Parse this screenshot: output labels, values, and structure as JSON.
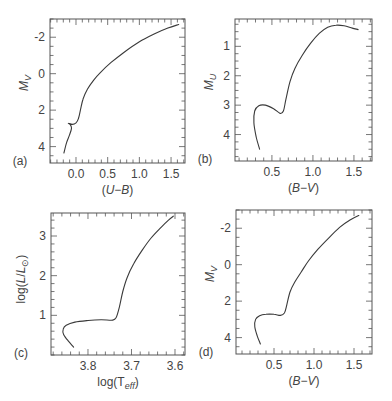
{
  "chart_data": [
    {
      "id": "a",
      "type": "line",
      "panel_label": "(a)",
      "title": "",
      "xlabel": "(U−B)",
      "ylabel": "M_V",
      "ylabel_main": "M",
      "ylabel_sub": "V",
      "xlim": [
        -0.41,
        1.72
      ],
      "ylim": [
        4.9,
        -3.0
      ],
      "y_inverted": true,
      "x_ticks": [
        0.0,
        0.5,
        1.0,
        1.5
      ],
      "x_tick_labels": [
        "0.0",
        "0.5",
        "1.0",
        "1.5"
      ],
      "x_minor_step": 0.1,
      "y_ticks": [
        -2,
        0,
        2,
        4
      ],
      "y_tick_labels": [
        "-2",
        "0",
        "2",
        "4"
      ],
      "y_minor_step": 0.5,
      "grid": false,
      "frame": {
        "left": 50,
        "top": 19,
        "right": 185,
        "bottom": 163
      },
      "series": [
        {
          "name": "isochrone",
          "points": [
            [
              -0.19,
              4.35
            ],
            [
              -0.15,
              3.8
            ],
            [
              -0.1,
              3.35
            ],
            [
              -0.07,
              3.0
            ],
            [
              -0.09,
              2.8
            ],
            [
              -0.12,
              2.72
            ],
            [
              -0.06,
              2.78
            ],
            [
              0.0,
              2.7
            ],
            [
              0.04,
              2.45
            ],
            [
              0.07,
              2.0
            ],
            [
              0.11,
              1.4
            ],
            [
              0.18,
              0.85
            ],
            [
              0.28,
              0.35
            ],
            [
              0.38,
              -0.05
            ],
            [
              0.55,
              -0.6
            ],
            [
              0.75,
              -1.15
            ],
            [
              1.0,
              -1.75
            ],
            [
              1.25,
              -2.2
            ],
            [
              1.45,
              -2.5
            ],
            [
              1.62,
              -2.7
            ]
          ]
        }
      ]
    },
    {
      "id": "b",
      "type": "line",
      "panel_label": "(b)",
      "title": "",
      "xlabel": "(B−V)",
      "ylabel": "M_U",
      "ylabel_main": "M",
      "ylabel_sub": "U",
      "xlim": [
        0.05,
        1.72
      ],
      "ylim": [
        4.9,
        0.07
      ],
      "y_inverted": true,
      "x_ticks": [
        0.5,
        1.0,
        1.5
      ],
      "x_tick_labels": [
        "0.5",
        "1.0",
        "1.5"
      ],
      "x_minor_step": 0.1,
      "y_ticks": [
        1,
        2,
        3,
        4
      ],
      "y_tick_labels": [
        "1",
        "2",
        "3",
        "4"
      ],
      "y_minor_step": 0.25,
      "grid": false,
      "frame": {
        "left": 235,
        "top": 19,
        "right": 372,
        "bottom": 161
      },
      "series": [
        {
          "name": "isochrone",
          "points": [
            [
              0.35,
              4.5
            ],
            [
              0.31,
              4.1
            ],
            [
              0.28,
              3.6
            ],
            [
              0.29,
              3.2
            ],
            [
              0.34,
              3.02
            ],
            [
              0.42,
              3.0
            ],
            [
              0.52,
              3.12
            ],
            [
              0.6,
              3.28
            ],
            [
              0.64,
              3.2
            ],
            [
              0.67,
              2.8
            ],
            [
              0.72,
              2.2
            ],
            [
              0.78,
              1.75
            ],
            [
              0.87,
              1.3
            ],
            [
              0.97,
              0.9
            ],
            [
              1.08,
              0.55
            ],
            [
              1.18,
              0.35
            ],
            [
              1.28,
              0.28
            ],
            [
              1.38,
              0.3
            ],
            [
              1.48,
              0.38
            ],
            [
              1.55,
              0.43
            ]
          ]
        }
      ]
    },
    {
      "id": "c",
      "type": "line",
      "panel_label": "(c)",
      "title": "",
      "xlabel": "log(T_eff)",
      "xlabel_main": "log(T",
      "xlabel_sub": "eff",
      "xlabel_end": ")",
      "ylabel": "log(L/L_⊙)",
      "ylabel_main": "log(L/L",
      "ylabel_sub": "⊙",
      "ylabel_end": ")",
      "xlim": [
        3.885,
        3.577
      ],
      "x_inverted": true,
      "ylim": [
        0.0,
        3.58
      ],
      "x_ticks": [
        3.8,
        3.7,
        3.6
      ],
      "x_tick_labels": [
        "3.8",
        "3.7",
        "3.6"
      ],
      "x_minor_step": 0.02,
      "y_ticks": [
        1,
        2,
        3
      ],
      "y_tick_labels": [
        "1",
        "2",
        "3"
      ],
      "y_minor_step": 0.2,
      "grid": false,
      "frame": {
        "left": 51,
        "top": 213,
        "right": 185,
        "bottom": 355
      },
      "series": [
        {
          "name": "isochrone",
          "points": [
            [
              3.833,
              0.2
            ],
            [
              3.845,
              0.35
            ],
            [
              3.856,
              0.52
            ],
            [
              3.857,
              0.65
            ],
            [
              3.85,
              0.75
            ],
            [
              3.83,
              0.83
            ],
            [
              3.8,
              0.87
            ],
            [
              3.77,
              0.89
            ],
            [
              3.743,
              0.88
            ],
            [
              3.735,
              0.95
            ],
            [
              3.728,
              1.2
            ],
            [
              3.72,
              1.6
            ],
            [
              3.71,
              1.95
            ],
            [
              3.695,
              2.3
            ],
            [
              3.675,
              2.65
            ],
            [
              3.655,
              2.95
            ],
            [
              3.632,
              3.22
            ],
            [
              3.615,
              3.4
            ],
            [
              3.604,
              3.5
            ]
          ]
        }
      ]
    },
    {
      "id": "d",
      "type": "line",
      "panel_label": "(d)",
      "title": "",
      "xlabel": "(B−V)",
      "ylabel": "M_V",
      "ylabel_main": "M",
      "ylabel_sub": "V",
      "xlim": [
        0.025,
        1.725
      ],
      "ylim": [
        4.9,
        -3.0
      ],
      "y_inverted": true,
      "x_ticks": [
        0.5,
        1.0,
        1.5
      ],
      "x_tick_labels": [
        "0.5",
        "1.0",
        "1.5"
      ],
      "x_minor_step": 0.1,
      "y_ticks": [
        -2,
        0,
        2,
        4
      ],
      "y_tick_labels": [
        "-2",
        "0",
        "2",
        "4"
      ],
      "y_minor_step": 0.5,
      "grid": false,
      "frame": {
        "left": 236,
        "top": 210,
        "right": 372,
        "bottom": 354
      },
      "series": [
        {
          "name": "isochrone",
          "points": [
            [
              0.33,
              4.35
            ],
            [
              0.29,
              3.9
            ],
            [
              0.26,
              3.4
            ],
            [
              0.27,
              3.0
            ],
            [
              0.32,
              2.8
            ],
            [
              0.4,
              2.72
            ],
            [
              0.5,
              2.72
            ],
            [
              0.58,
              2.78
            ],
            [
              0.63,
              2.65
            ],
            [
              0.66,
              2.2
            ],
            [
              0.7,
              1.5
            ],
            [
              0.76,
              0.95
            ],
            [
              0.84,
              0.4
            ],
            [
              0.93,
              -0.2
            ],
            [
              1.05,
              -0.85
            ],
            [
              1.18,
              -1.45
            ],
            [
              1.32,
              -2.05
            ],
            [
              1.45,
              -2.45
            ],
            [
              1.56,
              -2.7
            ]
          ]
        }
      ]
    }
  ]
}
